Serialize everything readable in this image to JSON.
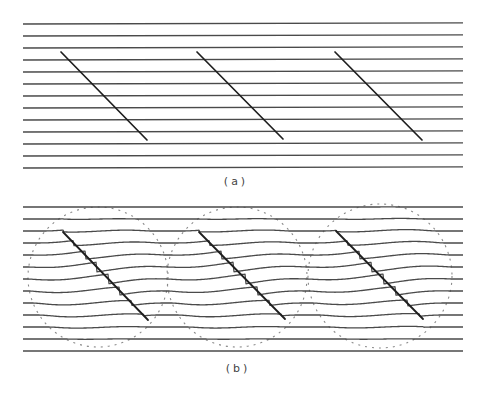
{
  "figure_a": {
    "caption": "(a)",
    "caption_pos": [
      236,
      183
    ],
    "lines": {
      "count": 13,
      "x_start": 23,
      "x_end": 463,
      "y_start": 24,
      "spacing": 12,
      "tilt": -1.2
    },
    "diagonals": [
      {
        "x1": 61,
        "y1": 52,
        "x2": 147,
        "y2": 140
      },
      {
        "x1": 197,
        "y1": 52,
        "x2": 283,
        "y2": 139
      },
      {
        "x1": 335,
        "y1": 52,
        "x2": 422,
        "y2": 140
      }
    ]
  },
  "figure_b": {
    "caption": "(b)",
    "caption_pos": [
      238,
      370
    ],
    "lines": {
      "count": 13,
      "x_start": 23,
      "x_end": 463,
      "y_start": 207,
      "spacing": 12
    },
    "diagonals": [
      {
        "x1": 63,
        "y1": 232,
        "x2": 148,
        "y2": 320
      },
      {
        "x1": 199,
        "y1": 232,
        "x2": 285,
        "y2": 319
      },
      {
        "x1": 336,
        "y1": 231,
        "x2": 423,
        "y2": 319
      }
    ],
    "circles": [
      {
        "cx": 98,
        "cy": 277,
        "r": 70
      },
      {
        "cx": 237,
        "cy": 277,
        "r": 70
      },
      {
        "cx": 380,
        "cy": 276,
        "r": 72
      }
    ],
    "warp_amplitude": 5
  },
  "colors": {
    "line": "#4a4a4a",
    "diagonal": "#1e1e1e",
    "circle": "#8a8a8a",
    "background": "#ffffff"
  }
}
